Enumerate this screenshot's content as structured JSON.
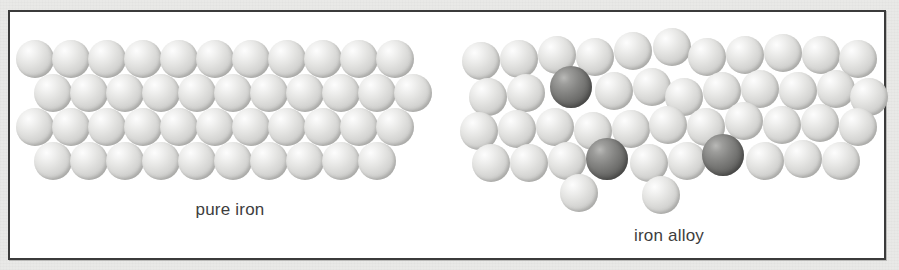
{
  "figure": {
    "background_color": "#e9e9e7",
    "frame_color": "#3b3b3b",
    "panel_color": "#ffffff"
  },
  "panels": [
    {
      "id": "pure-iron",
      "caption": "pure iron",
      "description": "regular close-packed lattice of identical iron atoms",
      "atom_colors": {
        "iron": "#d3d3d1"
      },
      "atom_diameter": 38,
      "rows": [
        {
          "count": 11,
          "offset_x": 6,
          "y": 28,
          "kinds": [
            "iron",
            "iron",
            "iron",
            "iron",
            "iron",
            "iron",
            "iron",
            "iron",
            "iron",
            "iron",
            "iron"
          ]
        },
        {
          "count": 11,
          "offset_x": 24,
          "y": 62,
          "kinds": [
            "iron",
            "iron",
            "iron",
            "iron",
            "iron",
            "iron",
            "iron",
            "iron",
            "iron",
            "iron",
            "iron"
          ]
        },
        {
          "count": 11,
          "offset_x": 6,
          "y": 96,
          "kinds": [
            "iron",
            "iron",
            "iron",
            "iron",
            "iron",
            "iron",
            "iron",
            "iron",
            "iron",
            "iron",
            "iron"
          ]
        },
        {
          "count": 10,
          "offset_x": 24,
          "y": 130,
          "kinds": [
            "iron",
            "iron",
            "iron",
            "iron",
            "iron",
            "iron",
            "iron",
            "iron",
            "iron",
            "iron"
          ]
        }
      ]
    },
    {
      "id": "iron-alloy",
      "caption": "iron alloy",
      "description": "distorted lattice of iron atoms with three larger alloying atoms",
      "atom_colors": {
        "iron": "#d3d3d1",
        "alloy": "#6f6f6d"
      },
      "atom_diameter": 38,
      "alloy_atom_count": 3,
      "iron_atom_count": 38,
      "atoms": [
        {
          "x": 12,
          "y": 30,
          "d": 38,
          "kind": "iron"
        },
        {
          "x": 50,
          "y": 28,
          "d": 38,
          "kind": "iron"
        },
        {
          "x": 88,
          "y": 24,
          "d": 38,
          "kind": "iron"
        },
        {
          "x": 126,
          "y": 26,
          "d": 38,
          "kind": "iron"
        },
        {
          "x": 164,
          "y": 20,
          "d": 38,
          "kind": "iron"
        },
        {
          "x": 203,
          "y": 16,
          "d": 38,
          "kind": "iron"
        },
        {
          "x": 238,
          "y": 26,
          "d": 38,
          "kind": "iron"
        },
        {
          "x": 276,
          "y": 24,
          "d": 38,
          "kind": "iron"
        },
        {
          "x": 314,
          "y": 22,
          "d": 38,
          "kind": "iron"
        },
        {
          "x": 352,
          "y": 24,
          "d": 38,
          "kind": "iron"
        },
        {
          "x": 389,
          "y": 28,
          "d": 38,
          "kind": "iron"
        },
        {
          "x": 19,
          "y": 66,
          "d": 38,
          "kind": "iron"
        },
        {
          "x": 57,
          "y": 62,
          "d": 38,
          "kind": "iron"
        },
        {
          "x": 100,
          "y": 54,
          "d": 42,
          "kind": "alloy"
        },
        {
          "x": 145,
          "y": 60,
          "d": 38,
          "kind": "iron"
        },
        {
          "x": 183,
          "y": 56,
          "d": 38,
          "kind": "iron"
        },
        {
          "x": 215,
          "y": 66,
          "d": 38,
          "kind": "iron"
        },
        {
          "x": 253,
          "y": 60,
          "d": 38,
          "kind": "iron"
        },
        {
          "x": 291,
          "y": 58,
          "d": 38,
          "kind": "iron"
        },
        {
          "x": 329,
          "y": 60,
          "d": 38,
          "kind": "iron"
        },
        {
          "x": 367,
          "y": 58,
          "d": 38,
          "kind": "iron"
        },
        {
          "x": 400,
          "y": 66,
          "d": 38,
          "kind": "iron"
        },
        {
          "x": 10,
          "y": 100,
          "d": 38,
          "kind": "iron"
        },
        {
          "x": 48,
          "y": 98,
          "d": 38,
          "kind": "iron"
        },
        {
          "x": 86,
          "y": 96,
          "d": 38,
          "kind": "iron"
        },
        {
          "x": 124,
          "y": 100,
          "d": 38,
          "kind": "iron"
        },
        {
          "x": 162,
          "y": 98,
          "d": 38,
          "kind": "iron"
        },
        {
          "x": 199,
          "y": 94,
          "d": 38,
          "kind": "iron"
        },
        {
          "x": 237,
          "y": 96,
          "d": 38,
          "kind": "iron"
        },
        {
          "x": 275,
          "y": 90,
          "d": 38,
          "kind": "iron"
        },
        {
          "x": 313,
          "y": 94,
          "d": 38,
          "kind": "iron"
        },
        {
          "x": 351,
          "y": 92,
          "d": 38,
          "kind": "iron"
        },
        {
          "x": 389,
          "y": 96,
          "d": 38,
          "kind": "iron"
        },
        {
          "x": 22,
          "y": 132,
          "d": 38,
          "kind": "iron"
        },
        {
          "x": 60,
          "y": 132,
          "d": 38,
          "kind": "iron"
        },
        {
          "x": 98,
          "y": 130,
          "d": 38,
          "kind": "iron"
        },
        {
          "x": 136,
          "y": 126,
          "d": 42,
          "kind": "alloy"
        },
        {
          "x": 180,
          "y": 132,
          "d": 38,
          "kind": "iron"
        },
        {
          "x": 218,
          "y": 130,
          "d": 38,
          "kind": "iron"
        },
        {
          "x": 252,
          "y": 122,
          "d": 42,
          "kind": "alloy"
        },
        {
          "x": 296,
          "y": 130,
          "d": 38,
          "kind": "iron"
        },
        {
          "x": 334,
          "y": 128,
          "d": 38,
          "kind": "iron"
        },
        {
          "x": 372,
          "y": 130,
          "d": 38,
          "kind": "iron"
        },
        {
          "x": 110,
          "y": 162,
          "d": 38,
          "kind": "iron"
        },
        {
          "x": 192,
          "y": 164,
          "d": 38,
          "kind": "iron"
        }
      ]
    }
  ]
}
